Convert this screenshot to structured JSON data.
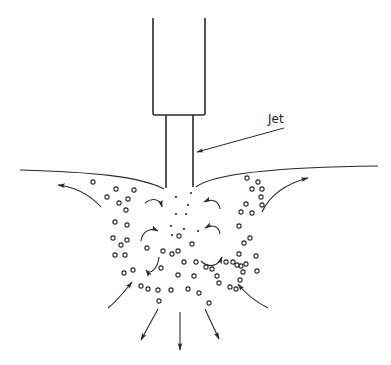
{
  "diagram": {
    "type": "jet entrainment schematic",
    "labels": {
      "jet": "Jet"
    },
    "colors": {
      "stroke": "#2a2a2a",
      "background": "#ffffff"
    },
    "nozzle": {
      "outer": {
        "x1": 153,
        "x2": 205,
        "top": 18,
        "bottom": 115
      },
      "inner": {
        "x1": 166,
        "x2": 193,
        "top": 115,
        "bottom": 188
      }
    },
    "leader": {
      "from": [
        284,
        128
      ],
      "to": [
        196,
        152
      ]
    },
    "bubbles": [
      [
        93,
        182
      ],
      [
        116,
        189
      ],
      [
        134,
        190
      ],
      [
        107,
        197
      ],
      [
        119,
        203
      ],
      [
        128,
        199
      ],
      [
        126,
        210
      ],
      [
        115,
        222
      ],
      [
        127,
        225
      ],
      [
        113,
        238
      ],
      [
        127,
        240
      ],
      [
        121,
        245
      ],
      [
        115,
        255
      ],
      [
        125,
        255
      ],
      [
        124,
        273
      ],
      [
        133,
        270
      ],
      [
        141,
        286
      ],
      [
        148,
        289
      ],
      [
        158,
        290
      ],
      [
        159,
        301
      ],
      [
        171,
        290
      ],
      [
        188,
        289
      ],
      [
        199,
        293
      ],
      [
        209,
        303
      ],
      [
        147,
        248
      ],
      [
        163,
        251
      ],
      [
        178,
        251
      ],
      [
        192,
        244
      ],
      [
        161,
        268
      ],
      [
        178,
        275
      ],
      [
        194,
        276
      ],
      [
        206,
        267
      ],
      [
        212,
        269
      ],
      [
        217,
        276
      ],
      [
        226,
        262
      ],
      [
        241,
        266
      ],
      [
        230,
        287
      ],
      [
        179,
        236
      ],
      [
        172,
        254
      ],
      [
        196,
        262
      ],
      [
        184,
        262
      ],
      [
        247,
        178
      ],
      [
        258,
        182
      ],
      [
        252,
        189
      ],
      [
        262,
        189
      ],
      [
        261,
        197
      ],
      [
        246,
        204
      ],
      [
        262,
        205
      ],
      [
        241,
        212
      ],
      [
        252,
        213
      ],
      [
        239,
        226
      ],
      [
        250,
        238
      ],
      [
        244,
        243
      ],
      [
        239,
        254
      ],
      [
        233,
        262
      ],
      [
        237,
        265
      ],
      [
        246,
        264
      ],
      [
        256,
        256
      ],
      [
        240,
        280
      ],
      [
        243,
        272
      ],
      [
        257,
        271
      ],
      [
        219,
        283
      ],
      [
        236,
        289
      ]
    ],
    "dots": [
      [
        176,
        197
      ],
      [
        191,
        193
      ],
      [
        188,
        205
      ],
      [
        176,
        214
      ],
      [
        186,
        214
      ],
      [
        171,
        226
      ],
      [
        184,
        229
      ],
      [
        198,
        231
      ],
      [
        172,
        235
      ]
    ],
    "outward_arrows": [
      "upper-left",
      "upper-right",
      "down-left",
      "down",
      "down-right"
    ],
    "inward_arrows": [
      "lower-left",
      "lower-right"
    ],
    "swirl_arrows": 6
  }
}
